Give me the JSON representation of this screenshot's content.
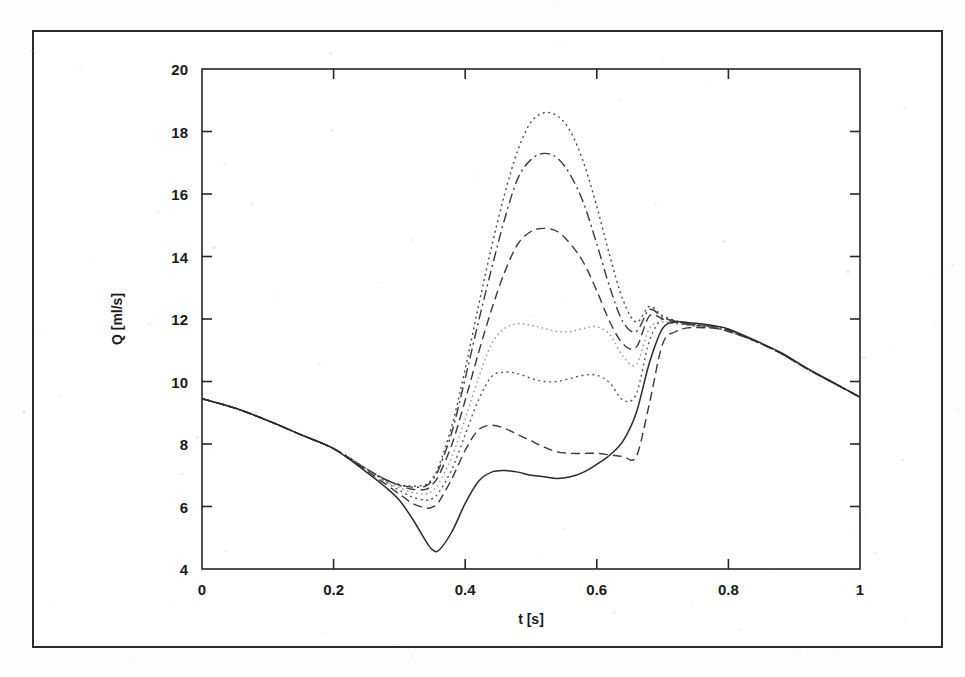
{
  "figure": {
    "background_color": "#ffffff",
    "frame_color": "#2b2b2b",
    "axis_color": "#262626"
  },
  "chart_data": {
    "type": "line",
    "title": "",
    "xlabel": "t [s]",
    "ylabel": "Q [ml/s]",
    "xlim": [
      0,
      1
    ],
    "ylim": [
      4,
      20
    ],
    "xticks": [
      0,
      0.2,
      0.4,
      0.6,
      0.8,
      1
    ],
    "xtick_labels": [
      "0",
      "0.2",
      "0.4",
      "0.6",
      "0.8",
      "1"
    ],
    "yticks": [
      4,
      6,
      8,
      10,
      12,
      14,
      16,
      18,
      20
    ],
    "ytick_labels": [
      "4",
      "6",
      "8",
      "10",
      "12",
      "14",
      "16",
      "18",
      "20"
    ],
    "grid": false,
    "legend": "none",
    "x": [
      0,
      0.05,
      0.1,
      0.15,
      0.2,
      0.25,
      0.28,
      0.3,
      0.32,
      0.34,
      0.35,
      0.36,
      0.38,
      0.4,
      0.42,
      0.44,
      0.46,
      0.48,
      0.5,
      0.52,
      0.54,
      0.56,
      0.58,
      0.6,
      0.62,
      0.64,
      0.66,
      0.68,
      0.7,
      0.72,
      0.74,
      0.76,
      0.78,
      0.8,
      0.84,
      0.88,
      0.92,
      0.96,
      1
    ],
    "series": [
      {
        "name": "curve-1-dotted-top",
        "style": "dotted",
        "color": "#4a4a4a",
        "peak_value": 18.6,
        "peak_time": 0.53,
        "values": [
          9.45,
          9.15,
          8.75,
          8.3,
          7.85,
          7.2,
          6.85,
          6.7,
          6.65,
          6.7,
          6.9,
          7.3,
          8.6,
          10.4,
          12.4,
          14.3,
          16.0,
          17.4,
          18.3,
          18.6,
          18.5,
          18.0,
          17.0,
          15.6,
          14.0,
          12.6,
          11.9,
          12.4,
          12.1,
          11.95,
          11.85,
          11.8,
          11.75,
          11.65,
          11.3,
          10.9,
          10.4,
          9.95,
          9.5
        ]
      },
      {
        "name": "curve-2-dashdot",
        "style": "dashdot",
        "color": "#3a3a3a",
        "peak_value": 17.3,
        "peak_time": 0.53,
        "values": [
          9.45,
          9.15,
          8.75,
          8.3,
          7.85,
          7.2,
          6.85,
          6.7,
          6.62,
          6.65,
          6.85,
          7.2,
          8.4,
          10.1,
          11.9,
          13.6,
          15.2,
          16.5,
          17.1,
          17.3,
          17.15,
          16.6,
          15.7,
          14.4,
          13.0,
          11.9,
          11.6,
          12.3,
          12.05,
          11.93,
          11.84,
          11.79,
          11.74,
          11.64,
          11.3,
          10.9,
          10.4,
          9.95,
          9.5
        ]
      },
      {
        "name": "curve-3-dashed",
        "style": "dashed",
        "color": "#3a3a3a",
        "peak_value": 14.9,
        "peak_time": 0.53,
        "values": [
          9.45,
          9.15,
          8.75,
          8.3,
          7.85,
          7.2,
          6.85,
          6.68,
          6.55,
          6.55,
          6.7,
          7.0,
          8.0,
          9.4,
          10.9,
          12.3,
          13.5,
          14.4,
          14.8,
          14.9,
          14.8,
          14.4,
          13.8,
          12.9,
          11.9,
          11.2,
          11.1,
          12.1,
          12.0,
          11.9,
          11.82,
          11.78,
          11.73,
          11.63,
          11.3,
          10.9,
          10.4,
          9.95,
          9.5
        ]
      },
      {
        "name": "curve-4-fine-dotted",
        "style": "fine-dotted",
        "color": "#9a9a9a",
        "peak_value": 11.9,
        "peak_time": 0.46,
        "values": [
          9.45,
          9.15,
          8.75,
          8.3,
          7.85,
          7.2,
          6.8,
          6.6,
          6.45,
          6.4,
          6.5,
          6.75,
          7.6,
          8.8,
          10.1,
          11.2,
          11.7,
          11.85,
          11.8,
          11.7,
          11.6,
          11.6,
          11.7,
          11.75,
          11.5,
          10.8,
          10.55,
          11.7,
          11.9,
          11.85,
          11.8,
          11.76,
          11.71,
          11.61,
          11.3,
          10.9,
          10.4,
          9.95,
          9.5
        ]
      },
      {
        "name": "curve-5-dotted-mid",
        "style": "dotted",
        "color": "#5a5a5a",
        "peak_value": 10.3,
        "peak_time": 0.46,
        "values": [
          9.45,
          9.15,
          8.75,
          8.3,
          7.85,
          7.2,
          6.78,
          6.52,
          6.3,
          6.2,
          6.25,
          6.45,
          7.2,
          8.3,
          9.4,
          10.15,
          10.3,
          10.25,
          10.1,
          10.0,
          10.0,
          10.1,
          10.2,
          10.2,
          9.95,
          9.4,
          9.6,
          11.3,
          12.0,
          11.88,
          11.8,
          11.75,
          11.7,
          11.6,
          11.3,
          10.9,
          10.4,
          9.95,
          9.5
        ]
      },
      {
        "name": "curve-6-dashed-low",
        "style": "dashed",
        "color": "#3a3a3a",
        "peak_value": 8.6,
        "peak_time": 0.45,
        "values": [
          9.45,
          9.15,
          8.75,
          8.3,
          7.85,
          7.15,
          6.7,
          6.4,
          6.1,
          5.95,
          5.98,
          6.15,
          6.9,
          7.8,
          8.45,
          8.6,
          8.5,
          8.3,
          8.1,
          7.9,
          7.75,
          7.7,
          7.7,
          7.7,
          7.65,
          7.6,
          7.6,
          9.3,
          11.2,
          11.6,
          11.72,
          11.72,
          11.7,
          11.6,
          11.3,
          10.9,
          10.4,
          9.95,
          9.5
        ]
      },
      {
        "name": "curve-7-solid",
        "style": "solid",
        "color": "#2a2a2a",
        "min_value": 4.6,
        "min_time": 0.35,
        "peak_value": 12.0,
        "peak_time": 0.71,
        "values": [
          9.45,
          9.15,
          8.75,
          8.3,
          7.85,
          7.1,
          6.6,
          6.2,
          5.6,
          4.9,
          4.62,
          4.6,
          5.2,
          6.1,
          6.8,
          7.1,
          7.15,
          7.1,
          7.0,
          6.95,
          6.9,
          6.95,
          7.1,
          7.35,
          7.65,
          8.1,
          9.0,
          10.6,
          11.7,
          11.9,
          11.88,
          11.84,
          11.78,
          11.68,
          11.32,
          10.92,
          10.42,
          9.96,
          9.5
        ]
      }
    ]
  }
}
